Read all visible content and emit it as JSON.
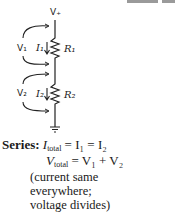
{
  "diagram": {
    "type": "series-circuit",
    "supply_label": "V+",
    "resistors": [
      {
        "name": "R1",
        "current": "I1",
        "voltage": "V1"
      },
      {
        "name": "R2",
        "current": "I2",
        "voltage": "V2"
      }
    ],
    "ground": "ground-symbol"
  },
  "caption": {
    "heading": "Series:",
    "eq1": {
      "lhs": "I",
      "lhs_sub": "total",
      "rhs": "= I₁ = I₂"
    },
    "eq2": {
      "lhs": "V",
      "lhs_sub": "total",
      "rhs": "= V₁ + V₂"
    },
    "note_line1": "(current same",
    "note_line2": "everywhere;",
    "note_line3": "voltage divides)"
  },
  "colors": {
    "ink": "#222222",
    "topbar": "#9a9a9a"
  }
}
